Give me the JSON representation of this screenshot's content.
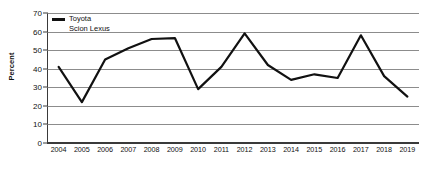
{
  "chart_data": {
    "type": "line",
    "title": "",
    "xlabel": "",
    "ylabel": "Percent",
    "ylim": [
      0,
      70
    ],
    "ytick_values": [
      70,
      60,
      50,
      40,
      30,
      20,
      10,
      0
    ],
    "ytick_labels": [
      "70",
      "60",
      "50",
      "40",
      "30",
      "20",
      "10",
      "0"
    ],
    "grid": true,
    "legend_position": "top-left",
    "categories": [
      "2004",
      "2005",
      "2006",
      "2007",
      "2008",
      "2009",
      "2010",
      "2011",
      "2012",
      "2013",
      "2014",
      "2015",
      "2016",
      "2017",
      "2018",
      "2019"
    ],
    "series": [
      {
        "name": "Toyota Scion Lexus",
        "name_line1": "Toyota",
        "name_line2": "Scion Lexus",
        "color": "#111111",
        "values": [
          41,
          22,
          45,
          51,
          56,
          56.5,
          29,
          41,
          59,
          42,
          34,
          37,
          35,
          58,
          36,
          25
        ]
      }
    ]
  },
  "legend": {
    "line1": "Toyota",
    "line2": "Scion Lexus"
  },
  "axes": {
    "y_title": "Percent"
  }
}
